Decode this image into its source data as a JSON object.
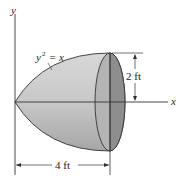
{
  "diagram": {
    "axes": {
      "x_label": "x",
      "y_label": "y"
    },
    "curve_label": {
      "base": "y",
      "exp": "2",
      "rest": " = x"
    },
    "dimensions": {
      "height": "2 ft",
      "length": "4 ft"
    },
    "colors": {
      "body_light": "#d2d2d2",
      "body_dark": "#a9a9a9",
      "end_face": "#8e8e8e",
      "stroke": "#333333"
    }
  }
}
